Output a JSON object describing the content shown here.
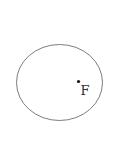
{
  "diagram": {
    "shape": "ellipse",
    "ellipse": {
      "cx": 59.5,
      "cy": 82.5,
      "rx": 43,
      "ry": 38,
      "stroke": "#6e6e6e"
    },
    "focus_point": {
      "x": 78.5,
      "y": 81.5,
      "r": 1.6,
      "color": "#111111"
    },
    "focus_label": "F"
  }
}
